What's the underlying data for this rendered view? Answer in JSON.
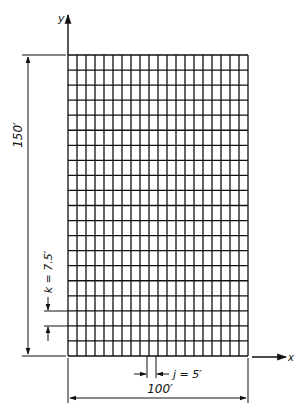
{
  "diagram": {
    "axes": {
      "x_label": "x",
      "y_label": "y"
    },
    "grid": {
      "columns": 20,
      "rows": 20,
      "line_color": "#111111"
    },
    "dimensions": {
      "width_label": "100′",
      "height_label": "150′",
      "cell_width_label": "j = 5′",
      "cell_height_label": "k = 7.5′"
    },
    "colors": {
      "background": "#ffffff",
      "ink": "#111111"
    }
  }
}
